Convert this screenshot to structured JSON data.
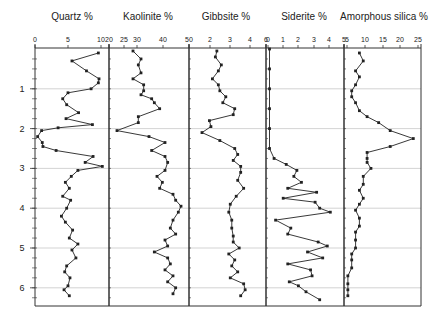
{
  "chart_data": {
    "type": "line",
    "y_axis": {
      "label": "Depth",
      "ticks": [
        1,
        2,
        3,
        4,
        5,
        6
      ],
      "range": [
        0,
        6.3
      ],
      "inverted": true,
      "gridlines": [
        1,
        2,
        3,
        4,
        5,
        6
      ]
    },
    "panels": [
      {
        "title": "Quartz %",
        "xlim": [
          0,
          10
        ],
        "x_ticks": [
          "0",
          "5",
          "10"
        ],
        "depth": [
          0.1,
          0.3,
          0.55,
          0.75,
          0.85,
          1.0,
          1.1,
          1.25,
          1.4,
          1.6,
          1.75,
          1.9,
          1.98,
          2.05,
          2.2,
          2.35,
          2.45,
          2.55,
          2.7,
          2.85,
          2.95,
          3.05,
          3.2,
          3.35,
          3.5,
          3.7,
          3.8,
          4.0,
          4.2,
          4.35,
          4.55,
          4.75,
          4.9,
          5.05,
          5.25,
          5.45,
          5.6,
          5.75,
          5.95,
          6.05,
          6.2
        ],
        "values": [
          9.6,
          5.6,
          7.8,
          9.7,
          9.6,
          8.5,
          5.0,
          4.2,
          4.8,
          6.6,
          4.7,
          8.7,
          3.5,
          1.0,
          0.4,
          1.1,
          1.2,
          3.2,
          8.8,
          7.6,
          10.2,
          6.5,
          5.5,
          4.6,
          5.2,
          4.2,
          5.4,
          4.8,
          4.0,
          4.6,
          5.7,
          5.2,
          6.5,
          5.6,
          6.2,
          4.8,
          4.5,
          5.3,
          5.0,
          4.4,
          5.2
        ]
      },
      {
        "title": "Kaolinite %",
        "xlim": [
          20,
          50
        ],
        "x_ticks": [
          "20",
          "25",
          "30",
          "40",
          "50"
        ],
        "depth": [
          0.05,
          0.25,
          0.4,
          0.6,
          0.75,
          0.9,
          1.05,
          1.15,
          1.25,
          1.35,
          1.5,
          1.7,
          1.85,
          2.05,
          2.2,
          2.35,
          2.55,
          2.7,
          2.85,
          3.05,
          3.2,
          3.35,
          3.5,
          3.65,
          3.8,
          3.95,
          4.1,
          4.3,
          4.5,
          4.65,
          4.8,
          4.95,
          5.1,
          5.25,
          5.4,
          5.55,
          5.7,
          5.85,
          6.0,
          6.15
        ],
        "values": [
          29,
          32,
          31,
          32,
          29,
          33,
          33,
          32,
          36,
          37,
          39,
          31,
          31,
          23,
          35,
          41,
          36,
          41,
          42,
          41,
          38,
          40,
          39,
          44,
          45,
          47,
          46,
          44,
          43,
          45,
          41,
          42,
          37,
          42,
          43,
          41,
          44,
          42,
          45,
          44
        ]
      },
      {
        "title": "Gibbsite %",
        "xlim": [
          1.5,
          6
        ],
        "x_ticks": [
          "2",
          "3",
          "4",
          "6"
        ],
        "depth": [
          0.05,
          0.2,
          0.4,
          0.55,
          0.75,
          0.9,
          1.05,
          1.2,
          1.35,
          1.5,
          1.65,
          1.8,
          1.95,
          2.1,
          2.3,
          2.5,
          2.65,
          2.8,
          2.95,
          3.1,
          3.3,
          3.5,
          3.7,
          3.9,
          4.1,
          4.3,
          4.5,
          4.7,
          4.85,
          5.0,
          5.15,
          5.3,
          5.45,
          5.6,
          5.75,
          5.9,
          6.05,
          6.2
        ],
        "values": [
          2.7,
          2.6,
          3.0,
          2.8,
          2.4,
          2.8,
          2.9,
          3.3,
          3.1,
          3.9,
          3.8,
          2.2,
          2.3,
          1.7,
          2.9,
          3.9,
          4.1,
          3.8,
          4.3,
          4.3,
          4.1,
          4.5,
          4.0,
          3.6,
          3.5,
          3.7,
          3.7,
          3.8,
          3.8,
          4.2,
          3.5,
          3.9,
          3.7,
          4.1,
          3.6,
          4.5,
          4.6,
          4.3
        ]
      },
      {
        "title": "Siderite %",
        "xlim": [
          0,
          5
        ],
        "x_ticks": [
          "0",
          "1",
          "2",
          "3",
          "4",
          "5"
        ],
        "depth": [
          0.0,
          0.5,
          1.0,
          1.5,
          2.0,
          2.5,
          2.75,
          2.9,
          3.05,
          3.2,
          3.35,
          3.5,
          3.6,
          3.75,
          3.85,
          4.0,
          4.1,
          4.3,
          4.5,
          4.65,
          4.85,
          4.95,
          5.1,
          5.25,
          5.4,
          5.55,
          5.7,
          5.85,
          5.95,
          6.1,
          6.3
        ],
        "values": [
          0.1,
          0.1,
          0.1,
          0.1,
          0.1,
          0.1,
          0.4,
          1.2,
          1.9,
          1.7,
          2.2,
          1.3,
          3.2,
          1.0,
          3.1,
          3.4,
          4.1,
          0.5,
          1.5,
          1.3,
          3.3,
          3.9,
          2.6,
          3.6,
          1.3,
          2.8,
          2.9,
          1.4,
          2.0,
          2.5,
          3.4
        ]
      },
      {
        "title": "Amorphous silica %",
        "xlim": [
          5,
          25
        ],
        "x_ticks": [
          "5",
          "10",
          "15",
          "20",
          "25"
        ],
        "depth": [
          0.1,
          0.3,
          0.55,
          0.7,
          0.9,
          1.05,
          1.2,
          1.35,
          1.55,
          1.7,
          1.85,
          2.05,
          2.25,
          2.45,
          2.6,
          2.75,
          2.85,
          3.0,
          3.2,
          3.4,
          3.55,
          3.75,
          3.9,
          4.05,
          4.25,
          4.45,
          4.6,
          4.8,
          5.0,
          5.15,
          5.3,
          5.5,
          5.7,
          5.9,
          6.05,
          6.2
        ],
        "values": [
          9,
          10,
          8,
          9,
          8,
          7,
          7,
          8,
          9,
          11,
          14,
          17,
          23,
          17,
          11,
          11,
          11,
          12,
          10,
          10,
          9,
          10,
          9,
          8,
          9,
          9,
          8,
          8,
          8,
          7,
          7,
          7,
          6,
          6,
          6,
          6
        ]
      }
    ]
  },
  "y_axis_labels": [
    "1",
    "2",
    "3",
    "4",
    "5",
    "6"
  ],
  "panel_titles": [
    "Quartz %",
    "Kaolinite %",
    "Gibbsite %",
    "Siderite %",
    "Amorphous silica %"
  ],
  "colors": {
    "line": "#222222",
    "grid": "#c8c8c8",
    "axis": "#333333",
    "background": "#ffffff"
  }
}
